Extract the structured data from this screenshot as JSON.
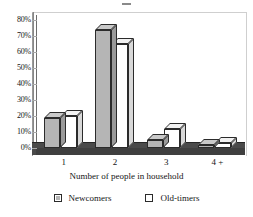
{
  "chart_data": {
    "type": "bar",
    "title": "",
    "xlabel": "Number of people in household",
    "ylabel": "",
    "categories": [
      "1",
      "2",
      "3",
      "4 +"
    ],
    "series": [
      {
        "name": "Newcomers",
        "color": "#b5b5b5",
        "values": [
          19,
          74,
          5,
          2
        ]
      },
      {
        "name": "Old-timers",
        "color": "#ffffff",
        "values": [
          20,
          65,
          12,
          3
        ]
      }
    ],
    "ylim": [
      0,
      80
    ],
    "yticks": [
      "0%",
      "10%",
      "20%",
      "30%",
      "40%",
      "50%",
      "60%",
      "70%",
      "80%"
    ],
    "ytick_values": [
      0,
      10,
      20,
      30,
      40,
      50,
      60,
      70,
      80
    ],
    "grid": false,
    "legend_position": "bottom",
    "style": "3d-column"
  },
  "legend": {
    "items": [
      {
        "label": "Newcomers",
        "swatch": "gray"
      },
      {
        "label": "Old-timers",
        "swatch": "white"
      }
    ]
  },
  "axis": {
    "x_title": "Number of people in household"
  }
}
